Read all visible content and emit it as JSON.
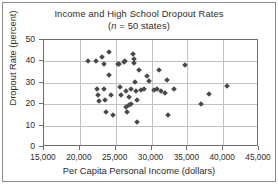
{
  "chart_data": {
    "type": "scatter",
    "title": "Income and High School Dropout Rates",
    "subtitle_prefix": "(",
    "subtitle_italic": "n",
    "subtitle_suffix": " = 50 states)",
    "subtitle_full": "(n = 50 states)",
    "xlabel": "Per Capita Personal Income (dollars)",
    "ylabel": "Dropout Rate (percent)",
    "xlim": [
      15000,
      45000
    ],
    "ylim": [
      0,
      50
    ],
    "xticks": [
      15000,
      20000,
      25000,
      30000,
      35000,
      40000,
      45000
    ],
    "xticklabels": [
      "15,000",
      "20,000",
      "25,000",
      "30,000",
      "35,000",
      "40,000",
      "45,000"
    ],
    "yticks": [
      0,
      10,
      20,
      30,
      40,
      50
    ],
    "yticklabels": [
      "0",
      "10",
      "20",
      "30",
      "40",
      "50"
    ],
    "grid": true,
    "legend": null,
    "marker": "diamond",
    "marker_color": "#4a4a4a",
    "n_points": 50,
    "points": [
      {
        "x": 21200,
        "y": 40.0
      },
      {
        "x": 22200,
        "y": 40.0
      },
      {
        "x": 22400,
        "y": 27.2
      },
      {
        "x": 22500,
        "y": 24.3
      },
      {
        "x": 22600,
        "y": 21.6
      },
      {
        "x": 23100,
        "y": 42.2
      },
      {
        "x": 23300,
        "y": 38.8
      },
      {
        "x": 23400,
        "y": 27.0
      },
      {
        "x": 23500,
        "y": 21.8
      },
      {
        "x": 23600,
        "y": 16.6
      },
      {
        "x": 24000,
        "y": 44.2
      },
      {
        "x": 24100,
        "y": 33.8
      },
      {
        "x": 24300,
        "y": 24.3
      },
      {
        "x": 24600,
        "y": 15.2
      },
      {
        "x": 25300,
        "y": 38.6
      },
      {
        "x": 25500,
        "y": 38.9
      },
      {
        "x": 25600,
        "y": 27.9
      },
      {
        "x": 25700,
        "y": 24.5
      },
      {
        "x": 26100,
        "y": 39.8
      },
      {
        "x": 26300,
        "y": 40.0
      },
      {
        "x": 26400,
        "y": 26.2
      },
      {
        "x": 26500,
        "y": 18.5
      },
      {
        "x": 26600,
        "y": 16.5
      },
      {
        "x": 26800,
        "y": 23.2
      },
      {
        "x": 26900,
        "y": 19.6
      },
      {
        "x": 27100,
        "y": 27.0
      },
      {
        "x": 27200,
        "y": 20.0
      },
      {
        "x": 27400,
        "y": 43.5
      },
      {
        "x": 27500,
        "y": 41.0
      },
      {
        "x": 27600,
        "y": 39.5
      },
      {
        "x": 27700,
        "y": 30.5
      },
      {
        "x": 27800,
        "y": 26.4
      },
      {
        "x": 27900,
        "y": 22.0
      },
      {
        "x": 28000,
        "y": 11.9
      },
      {
        "x": 28300,
        "y": 35.8
      },
      {
        "x": 28500,
        "y": 26.6
      },
      {
        "x": 29000,
        "y": 26.9
      },
      {
        "x": 29400,
        "y": 33.2
      },
      {
        "x": 29600,
        "y": 31.0
      },
      {
        "x": 30400,
        "y": 26.5
      },
      {
        "x": 30700,
        "y": 27.1
      },
      {
        "x": 31100,
        "y": 35.8
      },
      {
        "x": 31300,
        "y": 26.3
      },
      {
        "x": 31900,
        "y": 25.2
      },
      {
        "x": 32100,
        "y": 31.5
      },
      {
        "x": 32300,
        "y": 15.0
      },
      {
        "x": 33200,
        "y": 27.3
      },
      {
        "x": 34600,
        "y": 38.5
      },
      {
        "x": 36900,
        "y": 20.3
      },
      {
        "x": 38000,
        "y": 24.9
      },
      {
        "x": 40500,
        "y": 28.6
      }
    ]
  }
}
